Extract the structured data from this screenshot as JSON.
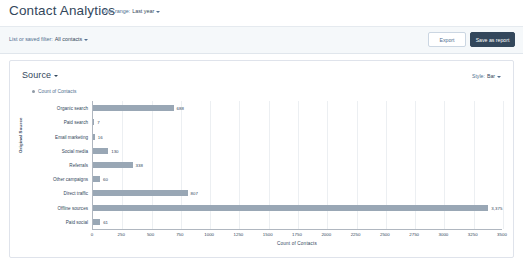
{
  "header": {
    "title": "Contact Analytics",
    "date_range_label": "Date range:",
    "date_range_value": "Last year"
  },
  "filterbar": {
    "filter_label": "List or saved filter:",
    "filter_value": "All contacts",
    "export_button": "Export",
    "save_report_button": "Save as report"
  },
  "card": {
    "title": "Source",
    "style_label": "Style:",
    "style_value": "Bar",
    "legend": "Count of Contacts"
  },
  "chart_data": {
    "type": "bar",
    "orientation": "horizontal",
    "title": "Source",
    "xlabel": "Count of Contacts",
    "ylabel": "Original Source",
    "legend": [
      "Count of Contacts"
    ],
    "legend_position": "top-left",
    "grid": true,
    "xlim": [
      0,
      3500
    ],
    "xticks": [
      0,
      250,
      500,
      750,
      1000,
      1250,
      1500,
      1750,
      2000,
      2250,
      2500,
      2750,
      3000,
      3250,
      3500
    ],
    "xtick_labels": [
      "0",
      "250",
      "500",
      "750",
      "1000",
      "1250",
      "1500",
      "1750",
      "2000",
      "2250",
      "2500",
      "2750",
      "3000",
      "3250",
      "3500"
    ],
    "categories": [
      "Organic search",
      "Paid search",
      "Email marketing",
      "Social media",
      "Referrals",
      "Other campaigns",
      "Direct traffic",
      "Offline sources",
      "Paid social"
    ],
    "values": [
      688,
      7,
      16,
      130,
      338,
      60,
      807,
      3375,
      61
    ],
    "value_labels": [
      "688",
      "7",
      "16",
      "130",
      "338",
      "60",
      "807",
      "3,375",
      "61"
    ],
    "bar_color": "#99a7b5"
  }
}
